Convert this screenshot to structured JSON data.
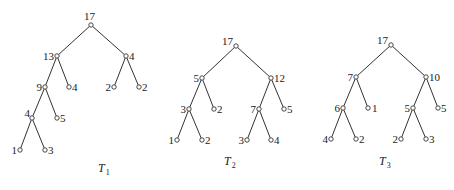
{
  "figure": {
    "trees": [
      {
        "id": "T1",
        "label": "T",
        "subscript": "1",
        "label_pos": [
          98,
          172
        ],
        "nodes": [
          {
            "id": "a",
            "value": "17",
            "x": 91,
            "y": 25,
            "lx": 84,
            "ly": 20,
            "anchor": "start"
          },
          {
            "id": "b",
            "value": "13",
            "x": 57,
            "y": 56,
            "lx": 54,
            "ly": 60,
            "anchor": "end"
          },
          {
            "id": "c",
            "value": "4",
            "x": 126,
            "y": 56,
            "lx": 129,
            "ly": 60,
            "anchor": "start"
          },
          {
            "id": "d",
            "value": "9",
            "x": 45,
            "y": 87,
            "lx": 42,
            "ly": 91,
            "anchor": "end"
          },
          {
            "id": "e",
            "value": "4",
            "x": 69,
            "y": 87,
            "lx": 72,
            "ly": 91,
            "anchor": "start"
          },
          {
            "id": "f",
            "value": "2",
            "x": 114,
            "y": 87,
            "lx": 111,
            "ly": 91,
            "anchor": "end"
          },
          {
            "id": "g",
            "value": "2",
            "x": 139,
            "y": 87,
            "lx": 142,
            "ly": 91,
            "anchor": "start"
          },
          {
            "id": "h",
            "value": "4",
            "x": 32,
            "y": 118,
            "lx": 30,
            "ly": 117,
            "anchor": "end"
          },
          {
            "id": "i",
            "value": "5",
            "x": 57,
            "y": 118,
            "lx": 60,
            "ly": 122,
            "anchor": "start"
          },
          {
            "id": "j",
            "value": "1",
            "x": 20,
            "y": 150,
            "lx": 17,
            "ly": 154,
            "anchor": "end"
          },
          {
            "id": "k",
            "value": "3",
            "x": 45,
            "y": 150,
            "lx": 48,
            "ly": 154,
            "anchor": "start"
          }
        ],
        "edges": [
          [
            "a",
            "b"
          ],
          [
            "a",
            "c"
          ],
          [
            "b",
            "d"
          ],
          [
            "b",
            "e"
          ],
          [
            "c",
            "f"
          ],
          [
            "c",
            "g"
          ],
          [
            "d",
            "h"
          ],
          [
            "d",
            "i"
          ],
          [
            "h",
            "j"
          ],
          [
            "h",
            "k"
          ]
        ]
      },
      {
        "id": "T2",
        "label": "T",
        "subscript": "2",
        "label_pos": [
          224,
          165
        ],
        "nodes": [
          {
            "id": "a",
            "value": "17",
            "x": 236,
            "y": 46,
            "lx": 233,
            "ly": 45,
            "anchor": "end"
          },
          {
            "id": "b",
            "value": "5",
            "x": 202,
            "y": 78,
            "lx": 199,
            "ly": 82,
            "anchor": "end"
          },
          {
            "id": "c",
            "value": "12",
            "x": 271,
            "y": 78,
            "lx": 274,
            "ly": 82,
            "anchor": "start"
          },
          {
            "id": "d",
            "value": "3",
            "x": 189,
            "y": 109,
            "lx": 186,
            "ly": 113,
            "anchor": "end"
          },
          {
            "id": "e",
            "value": "2",
            "x": 214,
            "y": 109,
            "lx": 217,
            "ly": 113,
            "anchor": "start"
          },
          {
            "id": "f",
            "value": "7",
            "x": 259,
            "y": 109,
            "lx": 256,
            "ly": 113,
            "anchor": "end"
          },
          {
            "id": "g",
            "value": "5",
            "x": 284,
            "y": 109,
            "lx": 287,
            "ly": 113,
            "anchor": "start"
          },
          {
            "id": "h",
            "value": "1",
            "x": 177,
            "y": 140,
            "lx": 174,
            "ly": 144,
            "anchor": "end"
          },
          {
            "id": "i",
            "value": "2",
            "x": 202,
            "y": 140,
            "lx": 205,
            "ly": 144,
            "anchor": "start"
          },
          {
            "id": "j",
            "value": "3",
            "x": 247,
            "y": 140,
            "lx": 244,
            "ly": 144,
            "anchor": "end"
          },
          {
            "id": "k",
            "value": "4",
            "x": 271,
            "y": 140,
            "lx": 274,
            "ly": 144,
            "anchor": "start"
          }
        ],
        "edges": [
          [
            "a",
            "b"
          ],
          [
            "a",
            "c"
          ],
          [
            "b",
            "d"
          ],
          [
            "b",
            "e"
          ],
          [
            "c",
            "f"
          ],
          [
            "c",
            "g"
          ],
          [
            "d",
            "h"
          ],
          [
            "d",
            "i"
          ],
          [
            "f",
            "j"
          ],
          [
            "f",
            "k"
          ]
        ]
      },
      {
        "id": "T3",
        "label": "T",
        "subscript": "3",
        "label_pos": [
          379,
          165
        ],
        "nodes": [
          {
            "id": "a",
            "value": "17",
            "x": 391,
            "y": 45,
            "lx": 388,
            "ly": 44,
            "anchor": "end"
          },
          {
            "id": "b",
            "value": "7",
            "x": 356,
            "y": 77,
            "lx": 353,
            "ly": 81,
            "anchor": "end"
          },
          {
            "id": "c",
            "value": "10",
            "x": 426,
            "y": 77,
            "lx": 429,
            "ly": 81,
            "anchor": "start"
          },
          {
            "id": "d",
            "value": "6",
            "x": 343,
            "y": 108,
            "lx": 340,
            "ly": 112,
            "anchor": "end"
          },
          {
            "id": "e",
            "value": "1",
            "x": 368,
            "y": 108,
            "lx": 372,
            "ly": 112,
            "anchor": "start"
          },
          {
            "id": "f",
            "value": "5",
            "x": 413,
            "y": 108,
            "lx": 410,
            "ly": 112,
            "anchor": "end"
          },
          {
            "id": "g",
            "value": "5",
            "x": 438,
            "y": 108,
            "lx": 441,
            "ly": 112,
            "anchor": "start"
          },
          {
            "id": "h",
            "value": "4",
            "x": 331,
            "y": 139,
            "lx": 328,
            "ly": 143,
            "anchor": "end"
          },
          {
            "id": "i",
            "value": "2",
            "x": 356,
            "y": 139,
            "lx": 359,
            "ly": 143,
            "anchor": "start"
          },
          {
            "id": "j",
            "value": "2",
            "x": 401,
            "y": 139,
            "lx": 398,
            "ly": 143,
            "anchor": "end"
          },
          {
            "id": "k",
            "value": "3",
            "x": 426,
            "y": 139,
            "lx": 429,
            "ly": 143,
            "anchor": "start"
          }
        ],
        "edges": [
          [
            "a",
            "b"
          ],
          [
            "a",
            "c"
          ],
          [
            "b",
            "d"
          ],
          [
            "b",
            "e"
          ],
          [
            "c",
            "f"
          ],
          [
            "c",
            "g"
          ],
          [
            "d",
            "h"
          ],
          [
            "d",
            "i"
          ],
          [
            "f",
            "j"
          ],
          [
            "f",
            "k"
          ]
        ]
      }
    ]
  }
}
